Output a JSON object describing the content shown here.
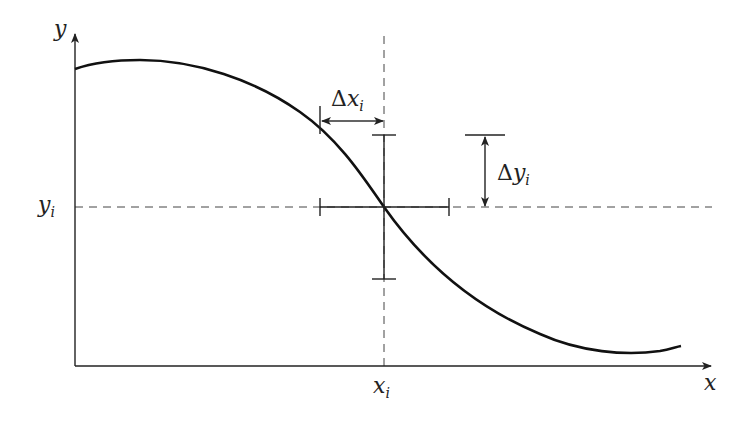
{
  "figure": {
    "type": "error-bar-diagram",
    "colors": {
      "ink": "#222222",
      "background": "#ffffff"
    },
    "axes": {
      "x_label": "x",
      "y_label": "y"
    },
    "point": {
      "x_label_var": "x",
      "x_label_sub": "i",
      "y_label_var": "y",
      "y_label_sub": "i"
    },
    "annotations": {
      "delta_x": {
        "symbol": "Δ",
        "var": "x",
        "sub": "i"
      },
      "delta_y": {
        "symbol": "Δ",
        "var": "y",
        "sub": "i"
      }
    },
    "curve_description": "smooth decreasing curve with a maximum near the y-axis and a minimum near the right end, passing through (x_i, y_i)"
  }
}
